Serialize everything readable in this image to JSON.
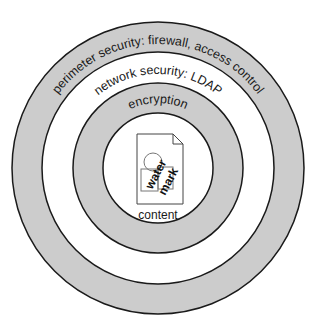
{
  "diagram": {
    "type": "concentric-layers",
    "colors": {
      "gray_ring": "#cccccc",
      "white_ring": "#ffffff",
      "stroke": "#1a1a1a"
    },
    "layers": [
      {
        "name": "perimeter",
        "label": "perimeter security: firewall, access control",
        "fill": "gray"
      },
      {
        "name": "network",
        "label": "network security: LDAP",
        "fill": "white"
      },
      {
        "name": "encryption",
        "label": "encryption",
        "fill": "gray"
      },
      {
        "name": "content",
        "label": "content",
        "fill": "white"
      }
    ],
    "watermark": {
      "line1": "water",
      "line2": "mark"
    }
  }
}
